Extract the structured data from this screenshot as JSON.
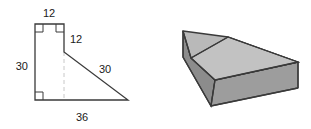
{
  "figure": {
    "colors": {
      "outline": "#3a3a3a",
      "hidden_edge": "#c8c8c8",
      "label_text": "#1a1a1a",
      "solid_top_face": "#b5b5b5",
      "solid_front_face": "#9b9b9b",
      "solid_left_face": "#8a8a8a",
      "solid_notch_face": "#c4c4c4",
      "background": "#ffffff"
    },
    "diagram_2d": {
      "name": "cross-section-polygon",
      "shape": "trapezoid-with-right-angles",
      "right_angle_marks": 3,
      "hidden_line": "dashed vertical segment from step corner down to base",
      "vertices": [
        {
          "id": "top-left",
          "x": 35,
          "y": 24
        },
        {
          "id": "top-right",
          "x": 64,
          "y": 24
        },
        {
          "id": "step-corner",
          "x": 64,
          "y": 52
        },
        {
          "id": "bottom-right-tip",
          "x": 128,
          "y": 100
        },
        {
          "id": "bottom-left",
          "x": 35,
          "y": 100
        }
      ],
      "labels": [
        {
          "id": "label-top",
          "text": "12",
          "x": 49,
          "y": 17,
          "anchor": "middle",
          "edge": "top-edge"
        },
        {
          "id": "label-right-upper",
          "text": "12",
          "x": 70,
          "y": 43,
          "anchor": "start",
          "edge": "upper-right-vertical-edge"
        },
        {
          "id": "label-left",
          "text": "30",
          "x": 27,
          "y": 66,
          "anchor": "end",
          "edge": "left-vertical-edge"
        },
        {
          "id": "label-slant",
          "text": "30",
          "x": 103,
          "y": 72,
          "anchor": "middle",
          "edge": "slanted-edge"
        },
        {
          "id": "label-bottom",
          "text": "36",
          "x": 82,
          "y": 120,
          "anchor": "middle",
          "edge": "bottom-edge"
        }
      ]
    },
    "diagram_3d": {
      "name": "pictorial-solid",
      "shape": "prism-with-stepped-top",
      "labels": [],
      "faces": [
        {
          "id": "top-face",
          "points": "183,31 228,37 293,62 215,80 191,58"
        },
        {
          "id": "notch-face",
          "points": "228,37 293,62 215,80"
        },
        {
          "id": "front-face",
          "points": "215,80 298,62 298,88 211,106"
        },
        {
          "id": "left-face",
          "points": "183,31 215,80 211,106 183,57"
        }
      ]
    }
  }
}
